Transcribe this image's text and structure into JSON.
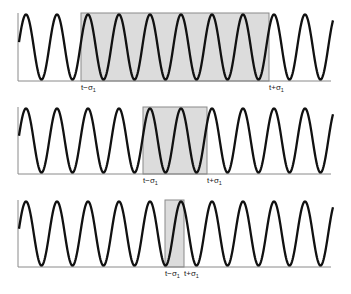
{
  "figure": {
    "colors": {
      "wave": "#111111",
      "window_fill": "#dcdcdc",
      "window_stroke": "#8a8a8a",
      "axis": "#8a8a8a"
    },
    "wave": {
      "x_start": 19,
      "x_end": 333,
      "period_px": 31,
      "phase_start": "rising-mid"
    },
    "panels": [
      {
        "id": "wide",
        "top": 13,
        "baseline": 81,
        "window": {
          "x0": 81,
          "x1": 269
        },
        "labels": {
          "left": "t−σ",
          "left_sub": "1",
          "right": "t+σ",
          "right_sub": "1"
        }
      },
      {
        "id": "medium",
        "top": 107,
        "baseline": 174,
        "window": {
          "x0": 143,
          "x1": 207
        },
        "labels": {
          "left": "t−σ",
          "left_sub": "1",
          "right": "t+σ",
          "right_sub": "1"
        }
      },
      {
        "id": "narrow",
        "top": 200,
        "baseline": 267,
        "window": {
          "x0": 165,
          "x1": 184
        },
        "labels": {
          "left": "t−σ",
          "left_sub": "1",
          "right": "t+σ",
          "right_sub": "1"
        }
      }
    ]
  }
}
